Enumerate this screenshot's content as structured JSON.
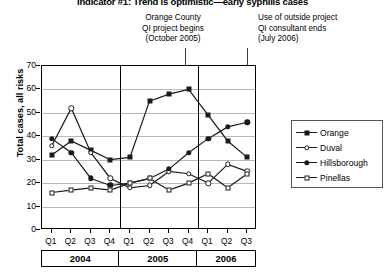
{
  "title": "Indicator #1: Trend is optimistic—early syphilis cases",
  "annotations": [
    {
      "id": "qi-project-begins",
      "lines": [
        "Orange County",
        "QI project begins",
        "(October 2005)"
      ],
      "target_quarter": "Q4 2005"
    },
    {
      "id": "consultant-ends",
      "lines": [
        "Use of outside project",
        "QI consultant ends",
        "(July 2006)"
      ],
      "target_quarter": "Q2 2006"
    }
  ],
  "axis": {
    "y_title": "Total cases, all risks",
    "y_ticks": [
      "0",
      "10",
      "20",
      "30",
      "40",
      "50",
      "60",
      "70"
    ],
    "x_ticks": [
      "Q1",
      "Q2",
      "Q3",
      "Q4",
      "Q1",
      "Q2",
      "Q3",
      "Q4",
      "Q1",
      "Q2",
      "Q3"
    ],
    "years": [
      {
        "label": "2004",
        "quarters": 4
      },
      {
        "label": "2005",
        "quarters": 4
      },
      {
        "label": "2006",
        "quarters": 3
      }
    ]
  },
  "legend": {
    "items": [
      {
        "label": "Orange",
        "marker": "filled-square"
      },
      {
        "label": "Duval",
        "marker": "open-circle"
      },
      {
        "label": "Hillsborough",
        "marker": "filled-circle"
      },
      {
        "label": "Pinellas",
        "marker": "open-square"
      }
    ]
  },
  "chart_data": {
    "type": "line",
    "title": "Indicator #1: Trend is optimistic—early syphilis cases",
    "xlabel": "",
    "ylabel": "Total cases, all risks",
    "ylim": [
      0,
      70
    ],
    "ytick_step": 10,
    "grid": true,
    "legend_position": "right",
    "categories": [
      "Q1 2004",
      "Q2 2004",
      "Q3 2004",
      "Q4 2004",
      "Q1 2005",
      "Q2 2005",
      "Q3 2005",
      "Q4 2005",
      "Q1 2006",
      "Q2 2006",
      "Q3 2006"
    ],
    "series": [
      {
        "name": "Orange",
        "marker": "filled-square",
        "values": [
          32,
          38,
          34,
          30,
          31,
          55,
          58,
          60,
          49,
          38,
          31
        ]
      },
      {
        "name": "Duval",
        "marker": "open-circle",
        "values": [
          36,
          52,
          33,
          22,
          18,
          19,
          25,
          24,
          20,
          28,
          25
        ]
      },
      {
        "name": "Hillsborough",
        "marker": "filled-circle",
        "values": [
          39,
          33,
          22,
          19,
          20,
          22,
          26,
          33,
          39,
          44,
          46
        ]
      },
      {
        "name": "Pinellas",
        "marker": "open-square",
        "values": [
          16,
          17,
          18,
          17,
          20,
          22,
          17,
          20,
          24,
          18,
          24
        ]
      }
    ],
    "annotations": [
      {
        "text": "Orange County QI project begins (October 2005)",
        "at": "Q4 2005"
      },
      {
        "text": "Use of outside project QI consultant ends (July 2006)",
        "at": "Q2 2006"
      }
    ]
  },
  "colors": {
    "ink": "#1a1a1a",
    "grid": "#b9b9b9",
    "frame": "#000000"
  }
}
